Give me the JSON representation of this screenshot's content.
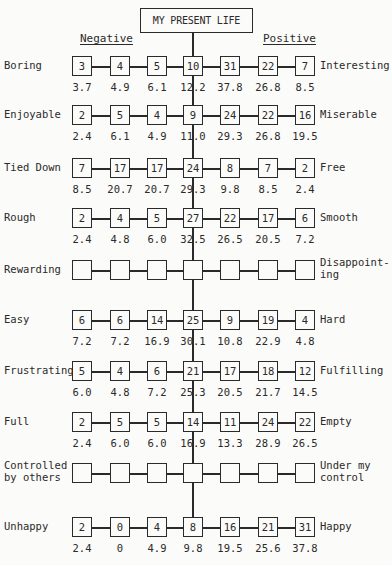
{
  "title": "MY PRESENT LIFE",
  "negative_label": "Negative",
  "positive_label": "Positive",
  "scales": [
    {
      "left": "Boring",
      "right": "Interesting",
      "counts": [
        "3",
        "4",
        "5",
        "10",
        "31",
        "22",
        "7"
      ],
      "percents": [
        "3.7",
        "4.9",
        "6.1",
        "12.2",
        "37.8",
        "26.8",
        "8.5"
      ]
    },
    {
      "left": "Enjoyable",
      "right": "Miserable",
      "counts": [
        "2",
        "5",
        "4",
        "9",
        "24",
        "22",
        "16"
      ],
      "percents": [
        "2.4",
        "6.1",
        "4.9",
        "11.0",
        "29.3",
        "26.8",
        "19.5"
      ]
    },
    {
      "left": "Tied Down",
      "right": "Free",
      "counts": [
        "7",
        "17",
        "17",
        "24",
        "8",
        "7",
        "2"
      ],
      "percents": [
        "8.5",
        "20.7",
        "20.7",
        "29.3",
        "9.8",
        "8.5",
        "2.4"
      ]
    },
    {
      "left": "Rough",
      "right": "Smooth",
      "counts": [
        "2",
        "4",
        "5",
        "27",
        "22",
        "17",
        "6"
      ],
      "percents": [
        "2.4",
        "4.8",
        "6.0",
        "32.5",
        "26.5",
        "20.5",
        "7.2"
      ]
    },
    {
      "left": "Rewarding",
      "right": "Disappoint-\ning",
      "counts": [
        "",
        "",
        "",
        "",
        "",
        "",
        ""
      ],
      "percents": [
        "",
        "",
        "",
        "",
        "",
        "",
        ""
      ]
    },
    {
      "left": "Easy",
      "right": "Hard",
      "counts": [
        "6",
        "6",
        "14",
        "25",
        "9",
        "19",
        "4"
      ],
      "percents": [
        "7.2",
        "7.2",
        "16.9",
        "30.1",
        "10.8",
        "22.9",
        "4.8"
      ]
    },
    {
      "left": "Frustrating",
      "right": "Fulfilling",
      "counts": [
        "5",
        "4",
        "6",
        "21",
        "17",
        "18",
        "12"
      ],
      "percents": [
        "6.0",
        "4.8",
        "7.2",
        "25.3",
        "20.5",
        "21.7",
        "14.5"
      ]
    },
    {
      "left": "Full",
      "right": "Empty",
      "counts": [
        "2",
        "5",
        "5",
        "14",
        "11",
        "24",
        "22"
      ],
      "percents": [
        "2.4",
        "6.0",
        "6.0",
        "16.9",
        "13.3",
        "28.9",
        "26.5"
      ]
    },
    {
      "left": "Controlled\nby others",
      "right": "Under my\ncontrol",
      "counts": [
        "",
        "",
        "",
        "",
        "",
        "",
        ""
      ],
      "percents": [
        "",
        "",
        "",
        "",
        "",
        "",
        ""
      ]
    },
    {
      "left": "Unhappy",
      "right": "Happy",
      "counts": [
        "2",
        "0",
        "4",
        "8",
        "16",
        "21",
        "31"
      ],
      "percents": [
        "2.4",
        "0",
        "4.9",
        "9.8",
        "19.5",
        "25.6",
        "37.8"
      ]
    }
  ]
}
